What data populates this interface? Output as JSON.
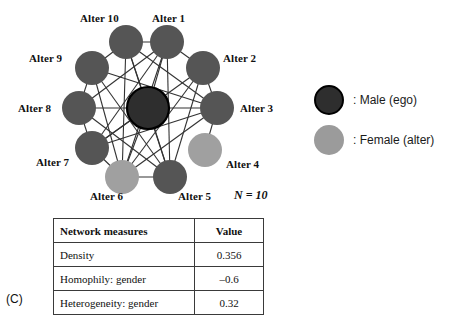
{
  "figure": {
    "panel_letter": "(C)",
    "n_annotation": "N = 10"
  },
  "network": {
    "ego": {
      "id": "ego",
      "label": "",
      "x": 148,
      "y": 108,
      "r": 21,
      "gender": "male",
      "color": "#2e2e2e",
      "stroke": "#000000"
    },
    "node_radius": 17,
    "male_color": "#555555",
    "female_color": "#a0a0a0",
    "edge_color": "#333333",
    "nodes": [
      {
        "id": "a1",
        "label": "Alter 1",
        "x": 167,
        "y": 42,
        "gender": "male",
        "color": "#555555",
        "label_x": 152,
        "label_y": 12
      },
      {
        "id": "a2",
        "label": "Alter 2",
        "x": 203,
        "y": 68,
        "gender": "male",
        "color": "#555555",
        "label_x": 223,
        "label_y": 52
      },
      {
        "id": "a3",
        "label": "Alter 3",
        "x": 217,
        "y": 108,
        "gender": "male",
        "color": "#555555",
        "label_x": 240,
        "label_y": 102
      },
      {
        "id": "a4",
        "label": "Alter 4",
        "x": 205,
        "y": 150,
        "gender": "female",
        "color": "#a0a0a0",
        "label_x": 226,
        "label_y": 158
      },
      {
        "id": "a5",
        "label": "Alter 5",
        "x": 170,
        "y": 177,
        "gender": "male",
        "color": "#555555",
        "label_x": 178,
        "label_y": 190
      },
      {
        "id": "a6",
        "label": "Alter 6",
        "x": 122,
        "y": 177,
        "gender": "female",
        "color": "#a0a0a0",
        "label_x": 90,
        "label_y": 190
      },
      {
        "id": "a7",
        "label": "Alter 7",
        "x": 92,
        "y": 148,
        "gender": "male",
        "color": "#555555",
        "label_x": 36,
        "label_y": 156
      },
      {
        "id": "a8",
        "label": "Alter 8",
        "x": 79,
        "y": 108,
        "gender": "male",
        "color": "#555555",
        "label_x": 18,
        "label_y": 102
      },
      {
        "id": "a9",
        "label": "Alter 9",
        "x": 92,
        "y": 68,
        "gender": "male",
        "color": "#555555",
        "label_x": 29,
        "label_y": 52
      },
      {
        "id": "a10",
        "label": "Alter 10",
        "x": 126,
        "y": 42,
        "gender": "male",
        "color": "#555555",
        "label_x": 80,
        "label_y": 12
      }
    ],
    "edges": [
      [
        "ego",
        "a1"
      ],
      [
        "ego",
        "a3"
      ],
      [
        "ego",
        "a5"
      ],
      [
        "ego",
        "a6"
      ],
      [
        "ego",
        "a7"
      ],
      [
        "ego",
        "a8"
      ],
      [
        "ego",
        "a10"
      ],
      [
        "a1",
        "a2"
      ],
      [
        "a2",
        "a3"
      ],
      [
        "a3",
        "a4"
      ],
      [
        "a5",
        "a6"
      ],
      [
        "a6",
        "a7"
      ],
      [
        "a7",
        "a8"
      ],
      [
        "a8",
        "a9"
      ],
      [
        "a9",
        "a10"
      ],
      [
        "a10",
        "a1"
      ],
      [
        "a1",
        "a5"
      ],
      [
        "a1",
        "a6"
      ],
      [
        "a1",
        "a7"
      ],
      [
        "a1",
        "a8"
      ],
      [
        "a10",
        "a3"
      ],
      [
        "a10",
        "a5"
      ],
      [
        "a10",
        "a6"
      ],
      [
        "a2",
        "a5"
      ],
      [
        "a2",
        "a6"
      ],
      [
        "a2",
        "a7"
      ],
      [
        "a3",
        "a6"
      ],
      [
        "a3",
        "a7"
      ],
      [
        "a3",
        "a9"
      ],
      [
        "a5",
        "a9"
      ],
      [
        "a5",
        "a8"
      ],
      [
        "a6",
        "a9"
      ]
    ]
  },
  "legend": {
    "items": [
      {
        "swatch": "male-circle",
        "text": ": Male (ego)",
        "color": "#2e2e2e"
      },
      {
        "swatch": "female-circle",
        "text": ": Female (alter)",
        "color": "#9b9b9b"
      }
    ]
  },
  "table": {
    "headers": [
      "Network measures",
      "Value"
    ],
    "rows": [
      {
        "measure": "Density",
        "value": "0.356"
      },
      {
        "measure": "Homophily: gender",
        "value": "–0.6"
      },
      {
        "measure": "Heterogeneity: gender",
        "value": "0.32"
      }
    ]
  }
}
